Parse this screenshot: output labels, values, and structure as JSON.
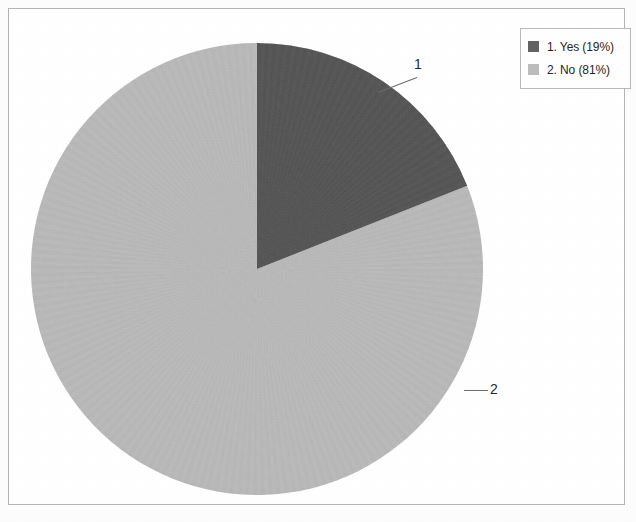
{
  "chart_data": {
    "type": "pie",
    "title": "",
    "subtitle": "",
    "xlabel": "",
    "ylabel": "",
    "legend_position": "top-right",
    "grid": false,
    "start_angle_deg": 0,
    "direction": "clockwise",
    "categories": [
      "1. Yes",
      "2. No"
    ],
    "values": [
      19,
      81
    ],
    "value_unit": "percent",
    "slices": [
      {
        "index": 1,
        "label": "1. Yes",
        "answer": "Yes",
        "percent": 19,
        "percent_text": "19%",
        "legend_text": "1. Yes (19%)",
        "callout": "1",
        "color": "#636363"
      },
      {
        "index": 2,
        "label": "2. No",
        "answer": "No",
        "percent": 81,
        "percent_text": "81%",
        "legend_text": "2. No (81%)",
        "callout": "2",
        "color": "#bcbcbc"
      }
    ]
  },
  "legend": {
    "entries": [
      {
        "swatch_color": "#636363",
        "text": "1. Yes (19%)"
      },
      {
        "swatch_color": "#bcbcbc",
        "text": "2. No (81%)"
      }
    ]
  },
  "callouts": [
    {
      "label": "1"
    },
    {
      "label": "2"
    }
  ],
  "colors": {
    "slice_dark": "#636363",
    "slice_light": "#bcbcbc",
    "frame_border": "#b4b4b4",
    "legend_border": "#b9b9b9",
    "text": "#262626",
    "leader_line": "#6d6d6d",
    "background": "#ffffff"
  }
}
